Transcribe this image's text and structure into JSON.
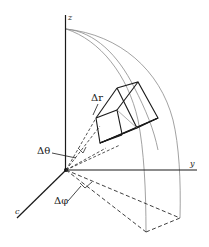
{
  "diagram": {
    "type": "spherical-coordinate-volume-element",
    "axes": {
      "z": {
        "label": "z"
      },
      "y": {
        "label": "y"
      },
      "x": {
        "label": "c"
      }
    },
    "increments": {
      "dr": {
        "label": "Δr"
      },
      "dtheta": {
        "label": "Δθ"
      },
      "dphi": {
        "label": "Δφ"
      }
    }
  },
  "colors": {
    "axis": "#1a1a1a",
    "arc": "#8a8a8a",
    "box": "#1a1a1a",
    "dashed": "#2a2a2a"
  }
}
